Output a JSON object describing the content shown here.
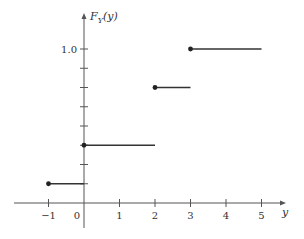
{
  "chart_data": {
    "type": "line",
    "subtype": "step-cdf",
    "title": "",
    "xlabel": "y",
    "ylabel": "F_Y(y)",
    "ylabel_main": "F",
    "ylabel_sub": "Y",
    "ylabel_arg": "(y)",
    "x_ticks": [
      -1,
      0,
      1,
      2,
      3,
      4,
      5
    ],
    "x_tick_labels": [
      "−1",
      "0",
      "1",
      "2",
      "3",
      "4",
      "5"
    ],
    "y_ticks": [
      0.125,
      0.25,
      0.375,
      0.5,
      0.625,
      0.75,
      0.875,
      1.0
    ],
    "y_tick_labels": [
      "1.0"
    ],
    "y_tick_labeled_value": 1.0,
    "xlim": [
      -2,
      5.7
    ],
    "ylim": [
      0,
      1.2
    ],
    "grid": false,
    "legend": null,
    "steps": [
      {
        "x_start": -1,
        "x_end": 0,
        "y": 0.125,
        "closed_left": true
      },
      {
        "x_start": 0,
        "x_end": 2,
        "y": 0.375,
        "closed_left": true
      },
      {
        "x_start": 2,
        "x_end": 3,
        "y": 0.75,
        "closed_left": true
      },
      {
        "x_start": 3,
        "x_end": 5,
        "y": 1.0,
        "closed_left": true
      }
    ],
    "zero_segment": {
      "x_start": -2,
      "x_end": -1,
      "y": 0
    },
    "colors": {
      "line": "#333333",
      "axis": "#555555",
      "dot": "#222222"
    }
  }
}
